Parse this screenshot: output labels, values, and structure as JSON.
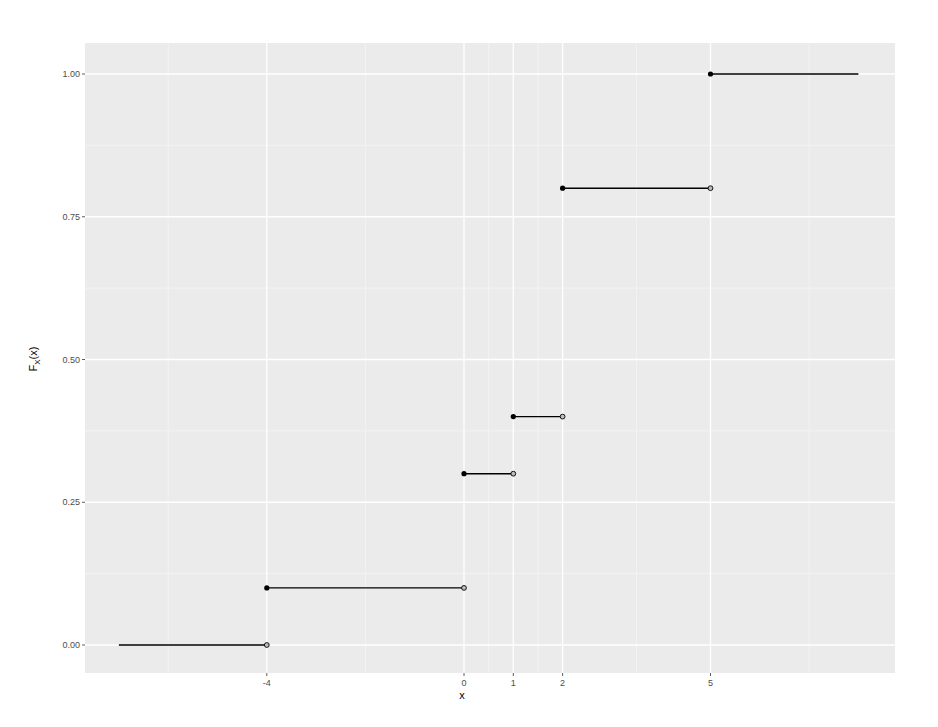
{
  "chart_data": {
    "type": "line",
    "subtype": "step-cdf",
    "title": "",
    "xlabel": "x",
    "ylabel": "F_X(x)",
    "ylabel_main": "F",
    "ylabel_sub": "X",
    "ylabel_tail": "(x)",
    "xlim": [
      -7.7,
      8.75
    ],
    "ylim": [
      -0.05,
      1.05
    ],
    "x_ticks": [
      -4,
      0,
      1,
      2,
      5
    ],
    "x_tick_labels": [
      "-4",
      "0",
      "1",
      "2",
      "5"
    ],
    "x_minor_breaks": [
      -6,
      -2,
      0.5,
      1.5,
      3.5,
      7
    ],
    "y_ticks": [
      0,
      0.25,
      0.5,
      0.75,
      1.0
    ],
    "y_tick_labels": [
      "0.00",
      "0.25",
      "0.50",
      "0.75",
      "1.00"
    ],
    "y_minor_breaks": [
      0.125,
      0.375,
      0.625,
      0.875
    ],
    "grid": true,
    "legend": "none",
    "segments": [
      {
        "x_start": -7,
        "x_end": -4,
        "y": 0.0,
        "closed_left": false,
        "open_right": true
      },
      {
        "x_start": -4,
        "x_end": 0,
        "y": 0.1,
        "closed_left": true,
        "open_right": true
      },
      {
        "x_start": 0,
        "x_end": 1,
        "y": 0.3,
        "closed_left": true,
        "open_right": true
      },
      {
        "x_start": 1,
        "x_end": 2,
        "y": 0.4,
        "closed_left": true,
        "open_right": true
      },
      {
        "x_start": 2,
        "x_end": 5,
        "y": 0.8,
        "closed_left": true,
        "open_right": true
      },
      {
        "x_start": 5,
        "x_end": 8,
        "y": 1.0,
        "closed_left": true,
        "open_right": false
      }
    ],
    "colors": {
      "panel_bg": "#ebebeb",
      "grid_major": "#ffffff",
      "grid_minor": "#f5f5f5",
      "line": "#000000",
      "open_point_fill": "#bdbdbd",
      "tick_text": "#4d4d4d"
    }
  }
}
